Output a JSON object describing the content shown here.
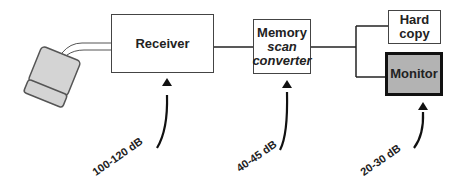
{
  "diagram": {
    "blocks": {
      "receiver": {
        "label": "Receiver"
      },
      "memory": {
        "line1": "Memory",
        "line2": "scan",
        "line3": "converter"
      },
      "hardcopy": {
        "line1": "Hard",
        "line2": "copy"
      },
      "monitor": {
        "label": "Monitor"
      }
    },
    "dynamic_ranges": [
      {
        "label": "100-120 dB",
        "stage": "Receiver"
      },
      {
        "label": "40-45 dB",
        "stage": "Memory scan converter"
      },
      {
        "label": "20-30 dB",
        "stage": "Monitor"
      }
    ],
    "colors": {
      "monitor_fill": "#b3b3b3",
      "transducer_fill": "#d4d4d4",
      "line": "#222222"
    }
  }
}
